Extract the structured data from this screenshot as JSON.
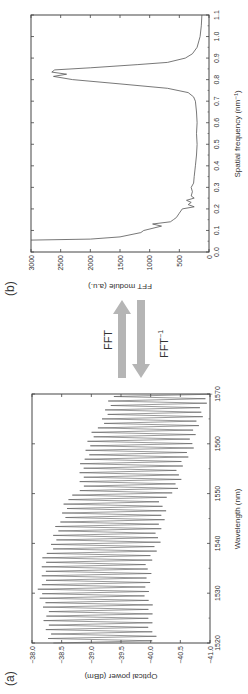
{
  "panels": {
    "a_label": "(a)",
    "b_label": "(b)"
  },
  "arrows": {
    "forward_label": "FFT",
    "inverse_label": "FFT",
    "inverse_superscript": "−1",
    "color": "#b5b5b5"
  },
  "chart_data": [
    {
      "type": "line",
      "panel": "(a)",
      "title": "",
      "xlabel": "Wavelength (nm)",
      "ylabel": "Optical power (dBm)",
      "xlim": [
        1520,
        1570
      ],
      "ylim": [
        -41.0,
        -38.0
      ],
      "xticks": [
        "1520",
        "1530",
        "1540",
        "1550",
        "1560",
        "1570"
      ],
      "yticks": [
        "−38.0",
        "−38.5",
        "−39.0",
        "−39.5",
        "−40.0",
        "−40.5",
        "−41.0"
      ],
      "grid": false,
      "description": "Dense interference fringes (period ~0.9 nm) between upper and lower envelopes",
      "envelope": {
        "x": [
          1520,
          1525,
          1530,
          1535,
          1538,
          1540,
          1545,
          1549,
          1550,
          1555,
          1560,
          1565,
          1570
        ],
        "upper": [
          -38.3,
          -38.25,
          -38.15,
          -38.2,
          -38.25,
          -38.35,
          -38.5,
          -38.6,
          -38.8,
          -38.85,
          -38.95,
          -39.2,
          -39.4
        ],
        "lower": [
          -40.05,
          -40.0,
          -39.95,
          -39.95,
          -40.05,
          -40.1,
          -40.2,
          -40.2,
          -40.4,
          -40.5,
          -40.7,
          -40.8,
          -41.0
        ]
      },
      "fringe_period_nm": 0.9
    },
    {
      "type": "line",
      "panel": "(b)",
      "title": "",
      "xlabel": "Spatial frequency (nm⁻¹)",
      "ylabel": "FFT module (a.u.)",
      "xlim": [
        0.0,
        1.1
      ],
      "ylim": [
        0,
        3000
      ],
      "xticks": [
        "0.0",
        "0.1",
        "0.2",
        "0.3",
        "0.4",
        "0.5",
        "0.6",
        "0.7",
        "0.8",
        "0.9",
        "1.0",
        "1.1"
      ],
      "yticks": [
        "0",
        "500",
        "1000",
        "1500",
        "2000",
        "2500",
        "3000"
      ],
      "grid": false,
      "x": [
        0.055,
        0.06,
        0.07,
        0.09,
        0.1,
        0.12,
        0.13,
        0.14,
        0.15,
        0.16,
        0.18,
        0.2,
        0.21,
        0.22,
        0.23,
        0.24,
        0.25,
        0.26,
        0.28,
        0.3,
        0.32,
        0.35,
        0.4,
        0.45,
        0.5,
        0.55,
        0.6,
        0.65,
        0.7,
        0.72,
        0.74,
        0.76,
        0.78,
        0.8,
        0.815,
        0.825,
        0.835,
        0.845,
        0.855,
        0.87,
        0.88,
        0.9,
        0.92,
        0.95,
        0.98,
        1.0,
        1.05,
        1.1
      ],
      "values": [
        3000,
        2000,
        1500,
        1150,
        1100,
        800,
        950,
        650,
        600,
        550,
        500,
        450,
        250,
        350,
        300,
        380,
        250,
        300,
        280,
        300,
        260,
        250,
        230,
        210,
        200,
        210,
        200,
        210,
        230,
        260,
        350,
        700,
        1500,
        2300,
        2620,
        2400,
        2650,
        2600,
        2000,
        1200,
        700,
        400,
        280,
        200,
        170,
        150,
        130,
        120
      ]
    }
  ]
}
